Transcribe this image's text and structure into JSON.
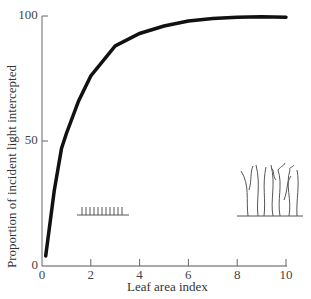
{
  "chart_data": {
    "type": "line",
    "title": "",
    "xlabel": "Leaf area index",
    "ylabel": "Proportion of incident light intercepted",
    "xlim": [
      0,
      10
    ],
    "ylim": [
      0,
      100
    ],
    "x_ticks": [
      "0",
      "2",
      "4",
      "6",
      "8",
      "10"
    ],
    "y_ticks": [
      "0",
      "50",
      "100"
    ],
    "grid": false,
    "series": [
      {
        "name": "Light interception",
        "x": [
          0.15,
          0.5,
          0.8,
          1,
          1.5,
          2,
          3,
          4,
          5,
          6,
          7,
          8,
          9,
          10
        ],
        "y": [
          4,
          30,
          47,
          53,
          66,
          76,
          88,
          93,
          96,
          98,
          99,
          99.5,
          99.7,
          99.5
        ]
      }
    ],
    "annotations": [
      {
        "type": "illustration",
        "description": "short sparse canopy (low LAI)",
        "x": 2.3,
        "y": 20
      },
      {
        "type": "illustration",
        "description": "tall dense canopy (high LAI)",
        "x": 8.8,
        "y": 20
      }
    ]
  }
}
